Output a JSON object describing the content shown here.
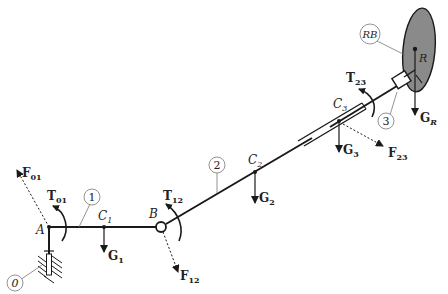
{
  "diagram": {
    "type": "mechanism free-body diagram",
    "parts": [
      {
        "id": "0",
        "label": "0",
        "desc": "ground / fixed support"
      },
      {
        "id": "1",
        "label": "1",
        "desc": "link 1"
      },
      {
        "id": "2",
        "label": "2",
        "desc": "link 2"
      },
      {
        "id": "3",
        "label": "3",
        "desc": "link 3 (slider)"
      },
      {
        "id": "RB",
        "label": "RB",
        "desc": "rigid body"
      }
    ],
    "points": {
      "A": "A",
      "B": "B",
      "C1": "C",
      "C1_sub": "1",
      "C2": "C",
      "C2_sub": "2",
      "C3": "C",
      "C3_sub": "3",
      "R": "R"
    },
    "forces": {
      "F01": {
        "main": "F",
        "sub": "01"
      },
      "F12": {
        "main": "F",
        "sub": "12"
      },
      "F23": {
        "main": "F",
        "sub": "23"
      },
      "G1": {
        "main": "G",
        "sub": "1"
      },
      "G2": {
        "main": "G",
        "sub": "2"
      },
      "G3": {
        "main": "G",
        "sub": "3"
      },
      "GR": {
        "main": "G",
        "sub": "R"
      }
    },
    "torques": {
      "T01": {
        "main": "T",
        "sub": "01"
      },
      "T12": {
        "main": "T",
        "sub": "12"
      },
      "T23": {
        "main": "T",
        "sub": "23"
      }
    },
    "colors": {
      "line": "#1a1a1a",
      "body_fill": "#8a8a8a",
      "leader": "#777777"
    }
  }
}
